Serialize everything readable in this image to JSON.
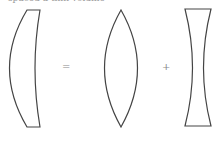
{
  "caption": "spaced a thin volume",
  "operators": {
    "equals": "=",
    "plus": "+"
  },
  "shapes": [
    "meniscus-lens",
    "biconvex-lens",
    "biconcave-lens"
  ],
  "colors": {
    "stroke": "#444444",
    "operator": "#888888"
  }
}
